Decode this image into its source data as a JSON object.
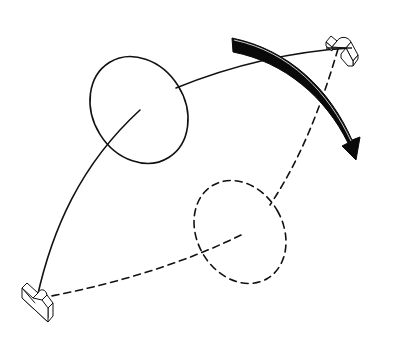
{
  "diagram": {
    "colors": {
      "stroke": "#111111",
      "background": "#ffffff",
      "arrow_fill": "#0a0a0a"
    },
    "elements": [
      {
        "id": "bracket-top-right",
        "type": "mounting-bracket"
      },
      {
        "id": "bracket-bottom-left",
        "type": "mounting-bracket"
      },
      {
        "id": "loop-solid",
        "type": "loop",
        "style": "solid"
      },
      {
        "id": "loop-dashed",
        "type": "loop",
        "style": "dashed"
      },
      {
        "id": "motion-arrow",
        "type": "curved-arrow",
        "direction": "clockwise"
      }
    ]
  }
}
